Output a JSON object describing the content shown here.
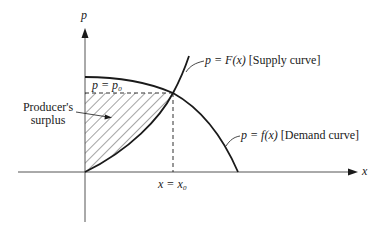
{
  "diagram": {
    "title": "Producer's surplus",
    "axes": {
      "y_label": "p",
      "x_label": "x"
    },
    "curves": {
      "supply": {
        "equation": "p = F(x)",
        "name": "[Supply curve]"
      },
      "demand": {
        "equation": "p = f(x)",
        "name": "[Demand curve]"
      }
    },
    "equilibrium": {
      "price_label": "p = p₀",
      "quantity_label": "x = x₀"
    },
    "region": {
      "label_line1": "Producer's",
      "label_line2": "surplus"
    },
    "colors": {
      "ink": "#1a1a1a",
      "axis": "#555555",
      "background": "#ffffff"
    }
  }
}
